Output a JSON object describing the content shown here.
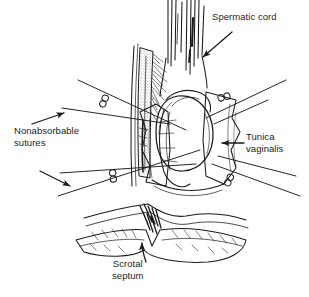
{
  "figure": {
    "background_color": "#ffffff",
    "ink_color": "#1a1a1a",
    "text_color": "#1c1c1c",
    "width": 309,
    "height": 297
  },
  "labels": {
    "spermatic_cord": "Spermatic cord",
    "nonabsorbable_sutures": "Nonabsorbable\nsutures",
    "tunica_vaginalis": "Tunica\nvaginalis",
    "scrotal_septum": "Scrotal\nseptum"
  },
  "anatomy": {
    "items": [
      {
        "name": "spermatic-cord",
        "label": "Spermatic cord",
        "description": "Vertical striated cord ascending at top center"
      },
      {
        "name": "testis",
        "label": "Testis",
        "description": "Central ovoid body"
      },
      {
        "name": "tunica-vaginalis",
        "label": "Tunica vaginalis",
        "description": "Everted membranous flap draped around testis"
      },
      {
        "name": "epididymis",
        "label": "Epididymis",
        "description": "Stippled vertical band left of testis"
      },
      {
        "name": "scrotal-septum",
        "label": "Scrotal septum",
        "description": "Layered horizontal tissue band with central notch"
      }
    ]
  },
  "sutures": {
    "type": "Nonabsorbable",
    "knot_count": 4,
    "thread_count": 4,
    "knots": [
      {
        "name": "knot-upper-left",
        "x": 104,
        "y": 101
      },
      {
        "name": "knot-lower-left",
        "x": 113,
        "y": 176
      },
      {
        "name": "knot-upper-right",
        "x": 224,
        "y": 97
      },
      {
        "name": "knot-lower-right",
        "x": 229,
        "y": 180
      }
    ]
  },
  "arrows": [
    {
      "name": "arrow-spermatic-cord",
      "points_to": "spermatic-cord",
      "direction": "down-left"
    },
    {
      "name": "arrow-sutures-upper",
      "points_to": "nonabsorbable-suture-upper",
      "direction": "up-right"
    },
    {
      "name": "arrow-sutures-lower",
      "points_to": "nonabsorbable-suture-lower",
      "direction": "down-left"
    },
    {
      "name": "arrow-tunica-vaginalis",
      "points_to": "tunica-vaginalis",
      "direction": "left"
    },
    {
      "name": "arrow-scrotal-septum",
      "points_to": "scrotal-septum",
      "direction": "up"
    }
  ]
}
